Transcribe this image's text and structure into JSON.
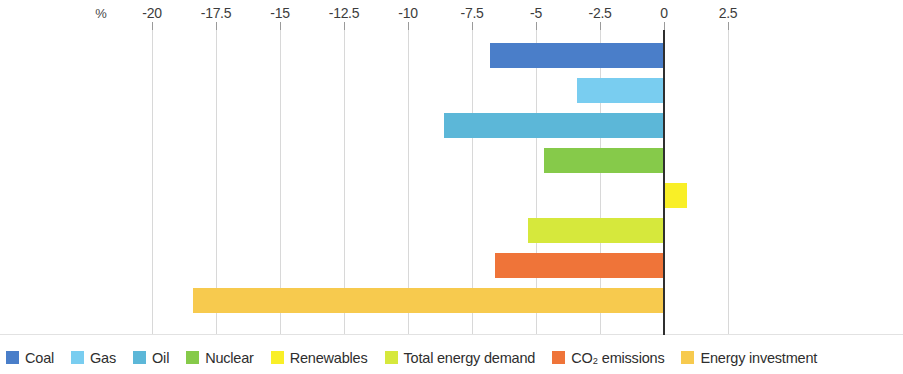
{
  "chart_data": {
    "type": "bar",
    "orientation": "horizontal",
    "title": "",
    "subtitle": "",
    "xlabel": "%",
    "ylabel": "",
    "xlim": [
      -21.5,
      3.5
    ],
    "xticks": [
      -20,
      -17.5,
      -15,
      -12.5,
      -10,
      -7.5,
      -5,
      -2.5,
      0,
      2.5
    ],
    "xticklabels": [
      "-20",
      "-17.5",
      "-15",
      "-12.5",
      "-10",
      "-7.5",
      "-5",
      "-2.5",
      "0",
      "2.5"
    ],
    "grid": true,
    "grid_axis": "x",
    "legend_position": "bottom",
    "unit_label": "%",
    "categories": [
      "Coal",
      "Gas",
      "Oil",
      "Nuclear",
      "Renewables",
      "Total energy demand",
      "CO₂ emissions",
      "Energy investment"
    ],
    "values": [
      -6.8,
      -3.4,
      -8.6,
      -4.7,
      0.9,
      -5.3,
      -6.6,
      -18.4
    ],
    "colors": [
      "#4a7ec9",
      "#79cdf0",
      "#5cb7d8",
      "#86ca4a",
      "#f9ef27",
      "#d6e83c",
      "#ef7439",
      "#f7ca4e"
    ]
  },
  "legend": {
    "items": [
      {
        "label": "Coal",
        "color": "#4a7ec9"
      },
      {
        "label": "Gas",
        "color": "#79cdf0"
      },
      {
        "label": "Oil",
        "color": "#5cb7d8"
      },
      {
        "label": "Nuclear",
        "color": "#86ca4a"
      },
      {
        "label": "Renewables",
        "color": "#f9ef27"
      },
      {
        "label": "Total energy demand",
        "color": "#d6e83c"
      },
      {
        "label": "CO₂ emissions",
        "color": "#ef7439"
      },
      {
        "label": "Energy investment",
        "color": "#f7ca4e"
      }
    ]
  }
}
